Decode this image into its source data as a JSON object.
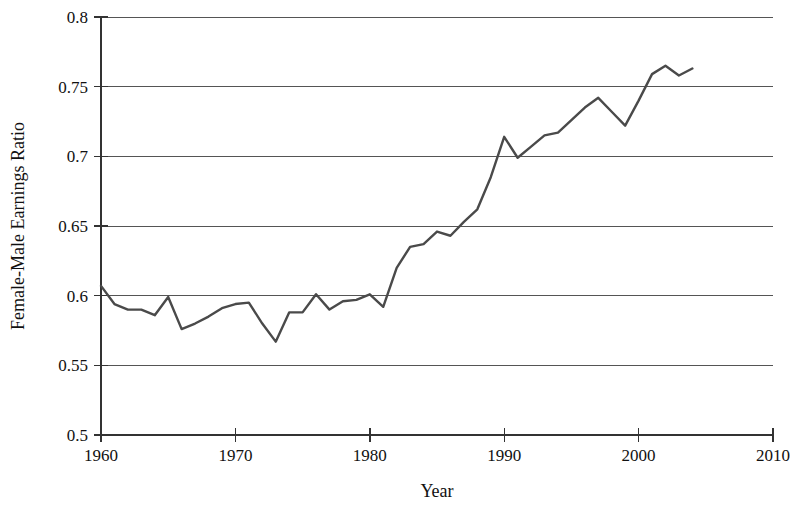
{
  "chart_data": {
    "type": "line",
    "title": "",
    "xlabel": "Year",
    "ylabel": "Female-Male Earnings Ratio",
    "xlim": [
      1960,
      2010
    ],
    "ylim": [
      0.5,
      0.8
    ],
    "xticks": [
      1960,
      1970,
      1980,
      1990,
      2000,
      2010
    ],
    "xtick_labels": [
      "1960",
      "1970",
      "1980",
      "1990",
      "2000",
      "2010"
    ],
    "yticks": [
      0.5,
      0.55,
      0.6,
      0.65,
      0.7,
      0.75,
      0.8
    ],
    "ytick_labels": [
      "0.5",
      "0.55",
      "0.6",
      "0.65",
      "0.7",
      "0.75",
      "0.8"
    ],
    "grid": "horizontal",
    "legend": "none",
    "line_color": "#4a4a4a",
    "x": [
      1960,
      1961,
      1962,
      1963,
      1964,
      1965,
      1966,
      1967,
      1968,
      1969,
      1970,
      1971,
      1972,
      1973,
      1974,
      1975,
      1976,
      1977,
      1978,
      1979,
      1980,
      1981,
      1982,
      1983,
      1984,
      1985,
      1986,
      1987,
      1988,
      1989,
      1990,
      1991,
      1992,
      1993,
      1994,
      1995,
      1996,
      1997,
      1998,
      1999,
      2000,
      2001,
      2002,
      2003,
      2004
    ],
    "values": [
      0.607,
      0.594,
      0.59,
      0.59,
      0.586,
      0.599,
      0.576,
      0.58,
      0.585,
      0.591,
      0.594,
      0.595,
      0.58,
      0.567,
      0.588,
      0.588,
      0.601,
      0.59,
      0.596,
      0.597,
      0.601,
      0.592,
      0.62,
      0.635,
      0.637,
      0.646,
      0.643,
      0.653,
      0.662,
      0.685,
      0.714,
      0.699,
      0.707,
      0.715,
      0.717,
      0.726,
      0.735,
      0.742,
      0.732,
      0.722,
      0.74,
      0.759,
      0.765,
      0.758,
      0.763
    ],
    "series": [
      {
        "name": "Female-Male Earnings Ratio",
        "values": [
          0.607,
          0.594,
          0.59,
          0.59,
          0.586,
          0.599,
          0.576,
          0.58,
          0.585,
          0.591,
          0.594,
          0.595,
          0.58,
          0.567,
          0.588,
          0.588,
          0.601,
          0.59,
          0.596,
          0.597,
          0.601,
          0.592,
          0.62,
          0.635,
          0.637,
          0.646,
          0.643,
          0.653,
          0.662,
          0.685,
          0.714,
          0.699,
          0.707,
          0.715,
          0.717,
          0.726,
          0.735,
          0.742,
          0.732,
          0.722,
          0.74,
          0.759,
          0.765,
          0.758,
          0.763
        ]
      }
    ]
  }
}
